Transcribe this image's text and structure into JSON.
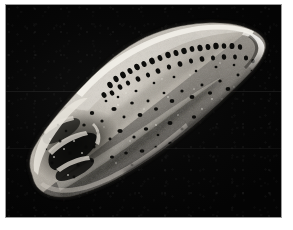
{
  "page": {
    "width": 293,
    "height": 230,
    "background_color": "#ffffff",
    "margin_color": "#ffffff"
  },
  "plate": {
    "name": "sem-micrograph-plate",
    "frame_border_color": "#9a9a9a",
    "background_color": "#070707",
    "left": 5,
    "top": 4,
    "width": 277,
    "height": 214,
    "modality": "scanning electron micrograph",
    "view": "lateral view",
    "orientation": "anterior to lower-left, posterior to upper-right",
    "visible_text": ""
  },
  "specimen": {
    "name": "ostracod-valve-specimen",
    "description": "Elongate sub-triangular calcareous microfossil valve, brightly lit against black field, tilted with long axis running from lower-left to upper-right.",
    "outline_orientation_degrees": -27,
    "surface_texture": "granular, finely pitted and abraded",
    "tones": {
      "highlight": "#dedad2",
      "midtone": "#a9a49a",
      "shadow": "#56524c",
      "deep_shadow": "#1b1a18",
      "pore": "#0a0a0a",
      "background": "#070707"
    },
    "features": [
      {
        "name": "dorsal-pore-row",
        "label": "row of large rounded normal pores along the dorsal margin",
        "count": 34,
        "region": "upper margin, anterior third to posterior third"
      },
      {
        "name": "posterior-flange",
        "label": "narrow bright posterior margin flange",
        "region": "right tip"
      },
      {
        "name": "anterior-broken-area",
        "label": "eroded / broken recess with dark cavities",
        "region": "lower-left (anteroventral) quarter"
      },
      {
        "name": "ventral-ridge",
        "label": "oblique ventral ridge and shadowed groove",
        "region": "lower centre"
      },
      {
        "name": "scattered-punctae",
        "label": "scattered irregular punctae and pits over the lateral surface",
        "count": 120
      }
    ]
  }
}
